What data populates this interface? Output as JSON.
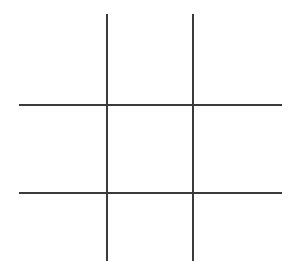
{
  "diagram": {
    "title": "",
    "type": "tic-tac-toe grid",
    "line_color": "#3a3a3a",
    "background": "#ffffff",
    "line_width": 2,
    "vertical_lines": [
      {
        "x": 107,
        "y1": 14,
        "y2": 261
      },
      {
        "x": 193,
        "y1": 14,
        "y2": 261
      }
    ],
    "horizontal_lines": [
      {
        "y": 105,
        "x1": 19,
        "x2": 282
      },
      {
        "y": 193,
        "x1": 19,
        "x2": 282
      }
    ],
    "cells": [
      "",
      "",
      "",
      "",
      "",
      "",
      "",
      "",
      ""
    ]
  }
}
